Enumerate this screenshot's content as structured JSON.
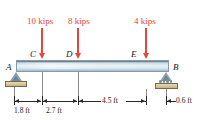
{
  "figure": {
    "type": "beam-free-body-diagram",
    "colors": {
      "load": "#e8453b",
      "beam_light": "#e8f1f6",
      "beam_dark": "#7e8e9c",
      "support": "#8fa6b5",
      "ground": "#d9c49c",
      "dimension": "#2a2a2a"
    }
  },
  "loads": [
    {
      "id": "load-10-kips",
      "label": "10 kips",
      "value": 10,
      "unit": "kips",
      "at_node": "C",
      "direction": "down"
    },
    {
      "id": "load-8-kips",
      "label": "8 kips",
      "value": 8,
      "unit": "kips",
      "at_node": "D",
      "direction": "down"
    },
    {
      "id": "load-4-kips",
      "label": "4 kips",
      "value": 4,
      "unit": "kips",
      "at_node": "E",
      "direction": "down"
    }
  ],
  "nodes": [
    {
      "id": "node-a",
      "label": "A",
      "role": "pin-support"
    },
    {
      "id": "node-c",
      "label": "C",
      "role": "load-point"
    },
    {
      "id": "node-d",
      "label": "D",
      "role": "load-point"
    },
    {
      "id": "node-e",
      "label": "E",
      "role": "load-point"
    },
    {
      "id": "node-b",
      "label": "B",
      "role": "roller-support"
    }
  ],
  "dimensions": [
    {
      "id": "dim-ac",
      "label": "1.8 ft",
      "value": 1.8,
      "unit": "ft",
      "from": "A",
      "to": "C"
    },
    {
      "id": "dim-cd",
      "label": "2.7 ft",
      "value": 2.7,
      "unit": "ft",
      "from": "C",
      "to": "D"
    },
    {
      "id": "dim-de",
      "label": "4.5 ft",
      "value": 4.5,
      "unit": "ft",
      "from": "D",
      "to": "E"
    },
    {
      "id": "dim-eb",
      "label": "0.6 ft",
      "value": 0.6,
      "unit": "ft",
      "from": "E",
      "to": "B"
    }
  ]
}
